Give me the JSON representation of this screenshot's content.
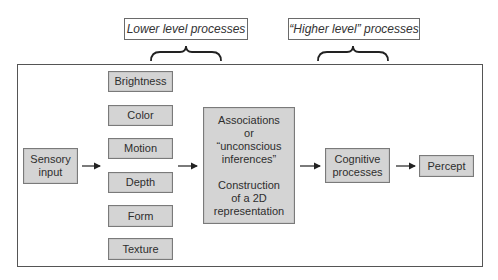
{
  "labels": {
    "lower": "Lower level processes",
    "higher": "“Higher level” processes"
  },
  "nodes": {
    "sensory_input": "Sensory\ninput",
    "features": [
      "Brightness",
      "Color",
      "Motion",
      "Depth",
      "Form",
      "Texture"
    ],
    "associations_line1": "Associations\nor\n“unconscious\ninferences”",
    "associations_line2": "Construction\nof a 2D\nrepresentation",
    "cognitive": "Cognitive\nprocesses",
    "percept": "Percept"
  },
  "colors": {
    "node_fill": "#d4d4d4",
    "node_border": "#7a7a7a",
    "frame_border": "#555555",
    "arrow": "#222222"
  }
}
